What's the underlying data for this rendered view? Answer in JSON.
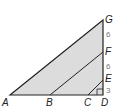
{
  "diagram": {
    "points": {
      "A": "A",
      "B": "B",
      "C": "C",
      "D": "D",
      "E": "E",
      "F": "F",
      "G": "G"
    },
    "segments": {
      "DE": "3",
      "EF": "6",
      "FG": "6"
    },
    "colors": {
      "fill": "#dcdcdc",
      "stroke": "#222222",
      "label": "#777777"
    }
  }
}
